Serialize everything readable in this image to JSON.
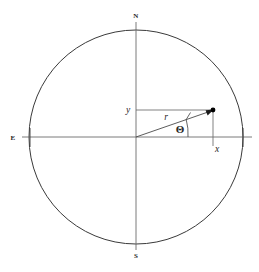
{
  "figure": {
    "background_color": "#ffffff",
    "stroke_color": "#3a3a3a",
    "axis_color": "#6b6b6b",
    "label_color": "#262626",
    "point_color": "#000000",
    "width": 259,
    "height": 272
  },
  "circle": {
    "center_x": 136,
    "center_y": 137,
    "radius": 107,
    "stroke_width": 1.0
  },
  "axes": {
    "vertical": {
      "x": 136,
      "y_top": 22,
      "y_bottom": 250
    },
    "horizontal": {
      "y": 137,
      "x_left": 22,
      "x_right": 252
    },
    "tick_left": {
      "x": 30,
      "y_top": 128,
      "y_bottom": 147
    },
    "tick_right": {
      "x": 243,
      "y_top": 128,
      "y_bottom": 147
    }
  },
  "cardinals": [
    {
      "name": "north",
      "label": "N",
      "x": 136,
      "y": 18
    },
    {
      "name": "south",
      "label": "S",
      "x": 136,
      "y": 258
    },
    {
      "name": "east",
      "label": "E",
      "x": 13,
      "y": 140
    }
  ],
  "vector": {
    "origin_x": 136,
    "origin_y": 137,
    "point_x": 213,
    "point_y": 110,
    "point_radius": 2.4,
    "arrow_label": "r"
  },
  "components": {
    "y_leg": {
      "x1": 136,
      "y1": 110,
      "x2": 213,
      "y2": 110
    },
    "x_leg": {
      "x1": 213,
      "y1": 110,
      "x2": 213,
      "y2": 146
    }
  },
  "angle_arc": {
    "radius": 52,
    "start_x": 188,
    "start_y": 137,
    "end_x": 186,
    "end_y": 119,
    "tick_x1": 186,
    "tick_y1": 119,
    "tick_x2": 190,
    "tick_y2": 112
  },
  "labels": {
    "y": {
      "text": "y",
      "x": 128,
      "y": 113
    },
    "x": {
      "text": "x",
      "x": 217,
      "y": 152
    },
    "r": {
      "text": "r",
      "x": 166,
      "y": 120
    },
    "theta": {
      "text": "Θ",
      "x": 180,
      "y": 133
    }
  }
}
